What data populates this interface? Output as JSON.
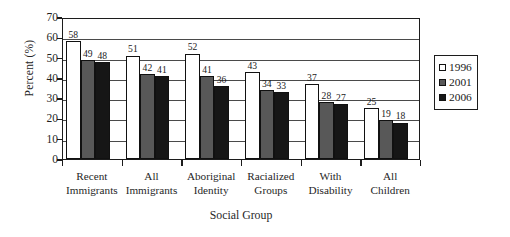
{
  "chart_data": {
    "type": "bar",
    "title": "",
    "subtitle": "",
    "xlabel": "Social Group",
    "ylabel": "Percent (%)",
    "ylim": [
      0,
      70
    ],
    "ytick_step": 10,
    "yticks": [
      70,
      60,
      50,
      40,
      30,
      20,
      10,
      0
    ],
    "grid": true,
    "grid_axis": "y",
    "legend_position": "right",
    "categories": [
      "Recent\nImmigrants",
      "All\nImmigrants",
      "Aboriginal\nIdentity",
      "Racialized\nGroups",
      "With\nDisability",
      "All\nChildren"
    ],
    "series": [
      {
        "name": "1996",
        "color": "#ffffff",
        "values": [
          58,
          51,
          52,
          43,
          37,
          25
        ]
      },
      {
        "name": "2001",
        "color": "#585858",
        "values": [
          49,
          42,
          41,
          34,
          28,
          19
        ]
      },
      {
        "name": "2006",
        "color": "#161616",
        "values": [
          48,
          41,
          36,
          33,
          27,
          18
        ]
      }
    ],
    "value_labels": true
  },
  "legend": {
    "items": [
      {
        "label": "1996",
        "swatch": "white-square-swatch"
      },
      {
        "label": "2001",
        "swatch": "gray-square-swatch"
      },
      {
        "label": "2006",
        "swatch": "black-square-swatch"
      }
    ]
  }
}
